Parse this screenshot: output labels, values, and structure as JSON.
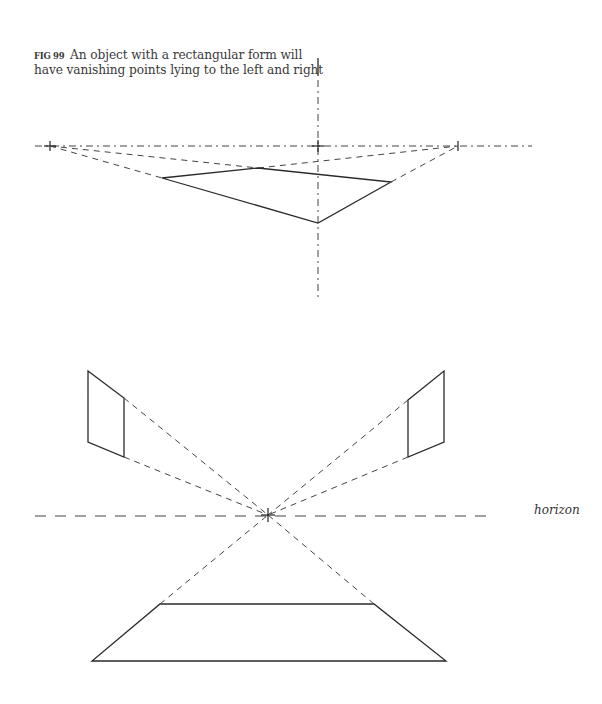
{
  "caption": {
    "figure_label": "FIG 99",
    "text": "An object with a rectangular form will have vanishing points lying to the left and right"
  },
  "annotations": {
    "horizon_label": "horizon"
  },
  "diagram": {
    "top": {
      "horizon_y": 146,
      "left_vp": [
        50,
        146
      ],
      "right_vp": [
        458,
        146
      ],
      "center_cross": [
        318,
        146
      ],
      "object_quad": [
        [
          162,
          178
        ],
        [
          258,
          168
        ],
        [
          391,
          182
        ],
        [
          318,
          223
        ]
      ]
    },
    "bottom": {
      "horizon_y": 516,
      "center_vp": [
        268,
        515
      ],
      "left_panel": [
        [
          88,
          371
        ],
        [
          124,
          398
        ],
        [
          124,
          457
        ],
        [
          88,
          442
        ]
      ],
      "right_panel": [
        [
          408,
          400
        ],
        [
          444,
          371
        ],
        [
          444,
          442
        ],
        [
          408,
          457
        ]
      ],
      "floor_trapezoid": [
        [
          160,
          604
        ],
        [
          374,
          604
        ],
        [
          446,
          661
        ],
        [
          92,
          661
        ]
      ]
    }
  }
}
